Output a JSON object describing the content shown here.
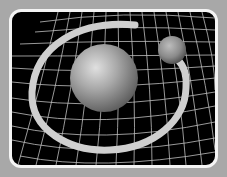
{
  "illustration": {
    "subject": "spacetime-curvature-orbit",
    "caption": "",
    "colors": {
      "background": "#a8a8a8",
      "frame_border": "#f4f4f4",
      "panel": "#000000",
      "grid": "#d8d8d8",
      "ring": "#cfcfcf",
      "sphere": "#9a9a9a"
    },
    "elements": [
      {
        "name": "grid",
        "type": "warped-mesh"
      },
      {
        "name": "large-sphere",
        "cx": 104,
        "cy": 78,
        "r": 34
      },
      {
        "name": "small-sphere",
        "cx": 172,
        "cy": 50,
        "r": 14
      },
      {
        "name": "orbit-ring",
        "cx": 108,
        "cy": 96,
        "rx": 80,
        "ry": 54
      }
    ]
  }
}
